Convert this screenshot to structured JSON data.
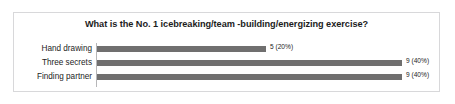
{
  "chart_data": {
    "type": "bar",
    "orientation": "horizontal",
    "title": "What is the No. 1 icebreaking/team -building/energizing exercise?",
    "xlabel": "",
    "ylabel": "",
    "grid": false,
    "legend": false,
    "xlim": [
      0,
      9
    ],
    "categories": [
      "Hand drawing",
      "Three secrets",
      "Finding partner"
    ],
    "values": [
      5,
      9,
      9
    ],
    "percentages": [
      "20%",
      "40%",
      "40%"
    ],
    "data_labels": [
      "5 (20%)",
      "9 (40%)",
      "9 (40%)"
    ],
    "bar_color": "#706f6f",
    "axis_color": "#b7b7b9",
    "border_color": "#d8d8da",
    "background": "#ffffff"
  }
}
